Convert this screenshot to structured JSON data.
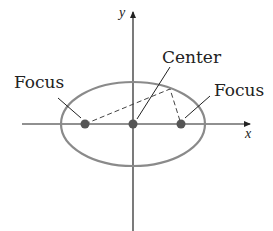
{
  "labels": {
    "center": "Center",
    "focus_left": "Focus",
    "focus_right": "Focus",
    "x_axis": "x",
    "y_axis": "y"
  },
  "colors": {
    "ellipse": "#8a8a8a",
    "points": "#555555",
    "axes": "#222222"
  }
}
